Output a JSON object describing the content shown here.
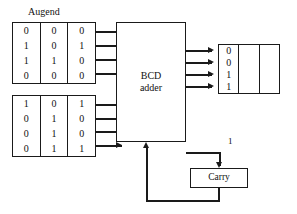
{
  "diagram": {
    "augend": {
      "label": "Augend",
      "columns": [
        {
          "bits": [
            "0",
            "1",
            "1",
            "0"
          ]
        },
        {
          "bits": [
            "0",
            "0",
            "1",
            "0"
          ]
        },
        {
          "bits": [
            "0",
            "1",
            "0",
            "0"
          ]
        }
      ]
    },
    "addend": {
      "label": "",
      "columns": [
        {
          "bits": [
            "1",
            "0",
            "0",
            "0"
          ]
        },
        {
          "bits": [
            "0",
            "1",
            "1",
            "1"
          ]
        },
        {
          "bits": [
            "1",
            "0",
            "0",
            "1"
          ]
        }
      ]
    },
    "sum": {
      "columns": [
        {
          "bits": [
            "0",
            "0",
            "1",
            "1"
          ]
        },
        {
          "bits": [
            "",
            "",
            "",
            ""
          ]
        },
        {
          "bits": [
            "",
            "",
            "",
            ""
          ]
        }
      ]
    },
    "adder_unit": {
      "line1": "BCD",
      "line2": "adder"
    },
    "carry_unit": {
      "label": "Carry"
    },
    "carry_flag": "1",
    "colors": {
      "line": "#1a1a1a",
      "text": "#111111",
      "background": "#ffffff"
    }
  }
}
